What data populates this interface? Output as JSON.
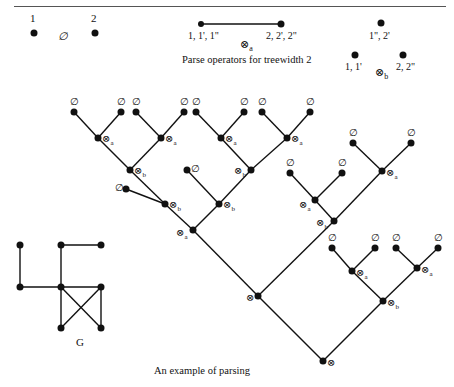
{
  "page": {
    "header_left": "150",
    "header_right": "12 Methods for Automata and Bounded Treewidth"
  },
  "operators": {
    "caption": "Parse operators for treewidth 2",
    "empty": {
      "symbol": "∅",
      "label_left": "1",
      "label_right": "2"
    },
    "join_a": {
      "symbol": "⊗",
      "subscript": "a",
      "label_left": "1, 1', 1\"",
      "label_right": "2, 2', 2\""
    },
    "join_b": {
      "symbol": "⊗",
      "subscript": "b",
      "label_top": "1\", 2'",
      "label_left": "1, 1'",
      "label_right": "2, 2\""
    }
  },
  "tree": {
    "caption": "An example of parsing",
    "leaf_symbol": "∅",
    "op_symbol": "⊗",
    "sub_a": "a",
    "sub_b": "b"
  },
  "graph": {
    "label": "G"
  }
}
